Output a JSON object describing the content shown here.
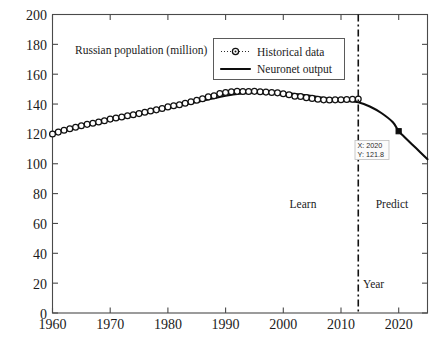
{
  "chart_data": {
    "type": "line",
    "title": "Russian population (million)",
    "xlabel": "Year",
    "ylabel": "",
    "xlim": [
      1960,
      2025
    ],
    "ylim": [
      0,
      200
    ],
    "xticks": [
      1960,
      1970,
      1980,
      1990,
      2000,
      2010,
      2020
    ],
    "xtick_labels": [
      "1960",
      "1970",
      "1980",
      "1990",
      "2000",
      "2010",
      "2020"
    ],
    "yticks": [
      0,
      20,
      40,
      60,
      80,
      100,
      120,
      140,
      160,
      180,
      200
    ],
    "ytick_labels": [
      "0",
      "20",
      "40",
      "60",
      "80",
      "100",
      "120",
      "140",
      "160",
      "180",
      "200"
    ],
    "grid": false,
    "legend_position": "top-center",
    "series": [
      {
        "name": "Historical data",
        "style": "dotted-line-with-circle-markers",
        "x": [
          1960,
          1961,
          1962,
          1963,
          1964,
          1965,
          1966,
          1967,
          1968,
          1969,
          1970,
          1971,
          1972,
          1973,
          1974,
          1975,
          1976,
          1977,
          1978,
          1979,
          1980,
          1981,
          1982,
          1983,
          1984,
          1985,
          1986,
          1987,
          1988,
          1989,
          1990,
          1991,
          1992,
          1993,
          1994,
          1995,
          1996,
          1997,
          1998,
          1999,
          2000,
          2001,
          2002,
          2003,
          2004,
          2005,
          2006,
          2007,
          2008,
          2009,
          2010,
          2011,
          2012,
          2013
        ],
        "values": [
          119.9,
          121.2,
          122.4,
          123.5,
          124.5,
          125.5,
          126.4,
          127.2,
          128.0,
          128.8,
          129.9,
          130.6,
          131.3,
          132.1,
          132.9,
          133.6,
          134.5,
          135.3,
          136.1,
          137.0,
          138.1,
          138.8,
          139.6,
          140.5,
          141.6,
          142.5,
          143.5,
          144.8,
          145.6,
          147.0,
          147.7,
          148.3,
          148.5,
          148.4,
          148.4,
          148.5,
          148.3,
          148.0,
          147.8,
          147.5,
          146.9,
          146.3,
          145.2,
          145.0,
          144.3,
          143.8,
          143.2,
          142.8,
          142.7,
          142.8,
          142.9,
          143.0,
          143.2,
          143.3
        ]
      },
      {
        "name": "Neuronet output",
        "style": "solid-line",
        "x": [
          1960,
          1965,
          1970,
          1975,
          1980,
          1985,
          1990,
          1993,
          1996,
          2000,
          2004,
          2008,
          2011,
          2013,
          2015,
          2017,
          2019,
          2020,
          2021,
          2023,
          2025
        ],
        "values": [
          120.5,
          125.8,
          130.2,
          134.0,
          137.6,
          141.4,
          145.6,
          147.2,
          148.0,
          147.6,
          145.8,
          143.6,
          142.2,
          141.2,
          138.4,
          134.0,
          127.8,
          121.8,
          118.0,
          110.5,
          103.0
        ]
      }
    ],
    "annotations": [
      {
        "name": "plot-title-text",
        "text": "Russian population (million)",
        "x": 1964,
        "y": 181
      },
      {
        "name": "learn-region-label",
        "text": "Learn",
        "x": 2005,
        "y": 72
      },
      {
        "name": "predict-region-label",
        "text": "Predict",
        "x": 2019,
        "y": 72
      },
      {
        "name": "year-axis-label",
        "text": "Year",
        "x": 2015,
        "y": 19
      }
    ],
    "divider": {
      "name": "learn-predict-divider",
      "x": 2013,
      "style": "dash-dot"
    },
    "data_tip": {
      "x_label": "X: 2020",
      "y_label": "Y: 121.8",
      "x": 2020,
      "y": 121.8,
      "marker": "filled-square"
    },
    "colors": {
      "line": "#0d0d0d",
      "marker_face": "#ffffff",
      "marker_edge": "#111111",
      "axis": "#4a4a4a",
      "background": "#ffffff"
    }
  },
  "legend": {
    "entries": [
      {
        "label": "Historical data",
        "marker": "dotted-circle"
      },
      {
        "label": "Neuronet output",
        "marker": "solid-line"
      }
    ]
  }
}
